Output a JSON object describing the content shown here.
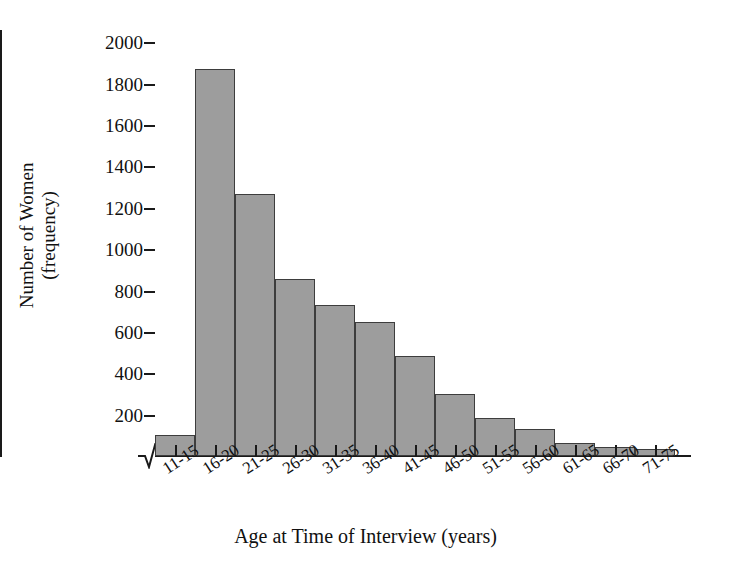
{
  "chart_data": {
    "type": "bar",
    "title": "",
    "xlabel": "Age at Time of Interview (years)",
    "ylabel_line1": "Number of Women",
    "ylabel_line2": "(frequency)",
    "categories": [
      "11-15",
      "16-20",
      "21-25",
      "26-30",
      "31-35",
      "36-40",
      "41-45",
      "46-50",
      "51-55",
      "56-60",
      "61-65",
      "66-70",
      "71-75"
    ],
    "values": [
      100,
      1870,
      1265,
      855,
      730,
      650,
      485,
      300,
      185,
      130,
      65,
      45,
      35
    ],
    "ylim": [
      0,
      2060
    ],
    "yticks": [
      200,
      400,
      600,
      800,
      1000,
      1200,
      1400,
      1600,
      1800,
      2000
    ],
    "ytick_labels": [
      "200",
      "400",
      "600",
      "800",
      "1000",
      "1200",
      "1400",
      "1600",
      "1800",
      "2000"
    ],
    "grid": false,
    "legend": false,
    "axis_break": true,
    "bar_color": "#9d9d9d",
    "bar_edge_color": "#3d3d3d",
    "axis_color": "#1a1a1a"
  }
}
